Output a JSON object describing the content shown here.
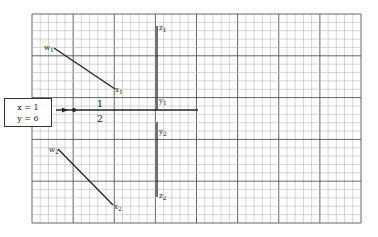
{
  "grid": {
    "x0": 32,
    "y0": 14,
    "x1": 361,
    "y1": 223,
    "minor": 8.3,
    "major_every": 5,
    "minor_color": "#b8b8b8",
    "major_color": "#555555"
  },
  "input_box": {
    "line1": "x = 1",
    "line2": "y = 6"
  },
  "fraction": {
    "numerator": "1",
    "denominator": "2"
  },
  "labels": {
    "w1": {
      "base": "w",
      "sub": "1"
    },
    "x1": {
      "base": "x",
      "sub": "1"
    },
    "w2": {
      "base": "w",
      "sub": "2"
    },
    "x2": {
      "base": "x",
      "sub": "2"
    },
    "z1": {
      "base": "z",
      "sub": "1"
    },
    "y1": {
      "base": "y",
      "sub": "1"
    },
    "y2": {
      "base": "y",
      "sub": "2"
    },
    "z2": {
      "base": "z",
      "sub": "2"
    }
  }
}
